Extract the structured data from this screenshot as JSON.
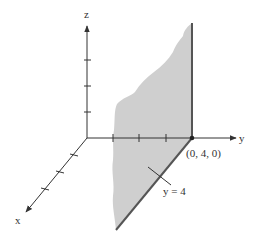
{
  "figure": {
    "type": "3d-coordinate-diagram",
    "axes": {
      "x_label": "x",
      "y_label": "y",
      "z_label": "z",
      "z_ticks": 3,
      "y_ticks": 3,
      "x_ticks": 3
    },
    "point_label": "(0, 4, 0)",
    "plane_label": "y = 4",
    "colors": {
      "plane_fill": "#cfcfcf",
      "plane_edge": "#555555",
      "axis": "#333333",
      "text": "#333333"
    }
  }
}
